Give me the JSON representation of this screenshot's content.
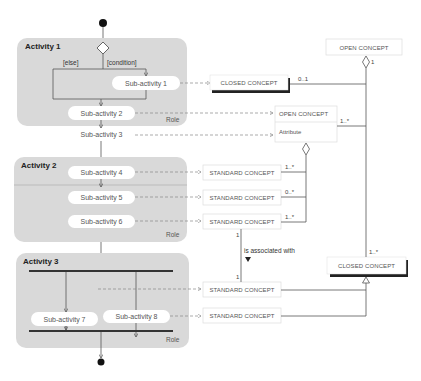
{
  "process": {
    "activities": [
      {
        "title": "Activity 1",
        "role": "Role",
        "guards": {
          "else": "[else]",
          "condition": "[condition]"
        },
        "sub_activities": [
          "Sub-activity 1",
          "Sub-activity 2",
          "Sub-activity 3"
        ]
      },
      {
        "title": "Activity 2",
        "role": "Role",
        "sub_activities": [
          "Sub-activity 4",
          "Sub-activity 5",
          "Sub-activity 6"
        ]
      },
      {
        "title": "Activity 3",
        "role": "Role",
        "sub_activities": [
          "Sub-activity 7",
          "Sub-activity 8"
        ]
      }
    ]
  },
  "concepts": {
    "open_top": "OPEN CONCEPT",
    "closed_1": "CLOSED CONCEPT",
    "open_attr": {
      "name": "OPEN CONCEPT",
      "attribute": "Attribute"
    },
    "standard": [
      "STANDARD CONCEPT",
      "STANDARD CONCEPT",
      "STANDARD CONCEPT",
      "STANDARD CONCEPT",
      "STANDARD CONCEPT"
    ],
    "closed_2": "CLOSED CONCEPT"
  },
  "multiplicities": {
    "open_top_agg": "1",
    "closed_1": "0..1",
    "open_attr": "1..*",
    "std1": "1..*",
    "std2": "0..*",
    "std3": "1..*",
    "std3_bottom": "1",
    "std4_top": "1",
    "closed_2_top": "1..*"
  },
  "association_label": "is associated with",
  "colors": {
    "activity_fill": "#d9d9d9",
    "sub_fill": "#ffffff",
    "line": "#555555",
    "dashed": "#888888",
    "bar": "#333333"
  }
}
